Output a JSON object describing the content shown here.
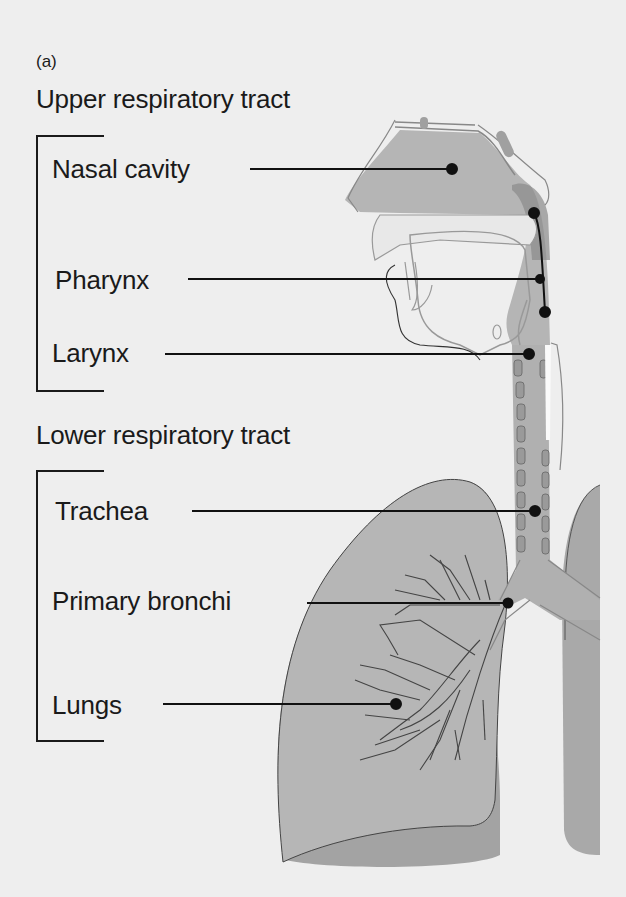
{
  "figure": {
    "panel_label": "(a)",
    "upper": {
      "title": "Upper respiratory tract",
      "labels": [
        "Nasal cavity",
        "Pharynx",
        "Larynx"
      ]
    },
    "lower": {
      "title": "Lower respiratory tract",
      "labels": [
        "Trachea",
        "Primary bronchi",
        "Lungs"
      ]
    }
  },
  "colors": {
    "background": "#eeeeee",
    "tissue": "#b3b3b3",
    "tissue_dark": "#9d9d9d",
    "outline": "#8a8a8a",
    "text": "#1a1a1a"
  }
}
